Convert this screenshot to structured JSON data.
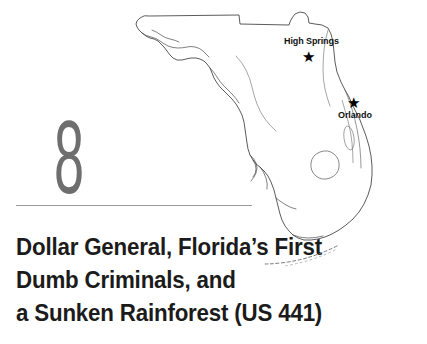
{
  "page": {
    "background_color": "#ffffff",
    "width": 427,
    "height": 344
  },
  "chapter": {
    "number": "8",
    "number_color": "#6e6e6e",
    "divider_color": "#9a9a9a"
  },
  "title": {
    "color": "#1b1b1b",
    "lines": [
      "Dollar General, Florida’s First",
      "Dumb Criminals, and",
      "a Sunken Rainforest (US 441)"
    ],
    "full_text": "Dollar General, Florida’s First Dumb Criminals, and a Sunken Rainforest (US 441)"
  },
  "map": {
    "region": "Florida",
    "outline_color": "#4a4a4a",
    "fill_color": "#ffffff",
    "marker_color": "#000000",
    "markers": [
      {
        "name": "High Springs",
        "label": "High Springs",
        "icon": "star-marker"
      },
      {
        "name": "Orlando",
        "label": "Orlando",
        "icon": "star-marker"
      }
    ],
    "features": [
      "state-outline",
      "gulf-coast",
      "atlantic-coast",
      "lake-okeechobee",
      "florida-keys",
      "panhandle"
    ],
    "star_glyph": "★"
  }
}
